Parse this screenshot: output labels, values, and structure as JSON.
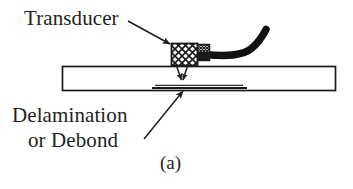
{
  "figure": {
    "caption": "(a)",
    "labels": {
      "transducer": "Transducer",
      "delamination_line1": "Delamination",
      "delamination_line2": "or Debond"
    },
    "colors": {
      "ink": "#231f20",
      "plate_stroke": "#1a1a1a",
      "cable": "#111111",
      "background": "#ffffff"
    },
    "parts": {
      "plate": "specimen-plate",
      "transducer_block": "crosshatched-transducer",
      "backing": "transducer-backing",
      "cable": "transducer-cable",
      "defect_line": "delamination-interface-line",
      "beam_arrows": "ultrasonic-beam-arrows",
      "leader_transducer": "transducer-leader-arrow",
      "leader_delamination": "delamination-leader-arrow"
    }
  }
}
